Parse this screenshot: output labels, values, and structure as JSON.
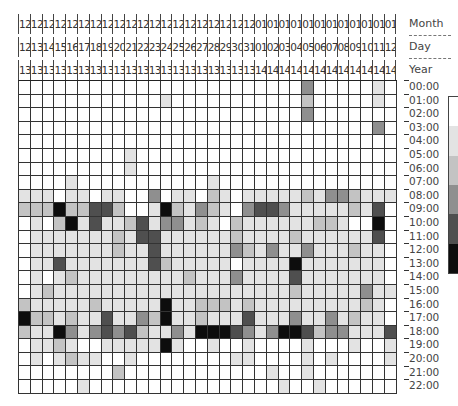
{
  "chart_data": {
    "type": "heatmap",
    "title": "",
    "axis_labels": {
      "month": "Month",
      "day": "Day",
      "year": "Year"
    },
    "columns": [
      {
        "month": "12",
        "day": "12",
        "year": "13"
      },
      {
        "month": "12",
        "day": "13",
        "year": "13"
      },
      {
        "month": "12",
        "day": "14",
        "year": "13"
      },
      {
        "month": "12",
        "day": "15",
        "year": "13"
      },
      {
        "month": "12",
        "day": "16",
        "year": "13"
      },
      {
        "month": "12",
        "day": "17",
        "year": "13"
      },
      {
        "month": "12",
        "day": "18",
        "year": "13"
      },
      {
        "month": "12",
        "day": "19",
        "year": "13"
      },
      {
        "month": "12",
        "day": "20",
        "year": "13"
      },
      {
        "month": "12",
        "day": "21",
        "year": "13"
      },
      {
        "month": "12",
        "day": "22",
        "year": "13"
      },
      {
        "month": "12",
        "day": "23",
        "year": "13"
      },
      {
        "month": "12",
        "day": "24",
        "year": "13"
      },
      {
        "month": "12",
        "day": "25",
        "year": "13"
      },
      {
        "month": "12",
        "day": "26",
        "year": "13"
      },
      {
        "month": "12",
        "day": "27",
        "year": "13"
      },
      {
        "month": "12",
        "day": "28",
        "year": "13"
      },
      {
        "month": "12",
        "day": "29",
        "year": "13"
      },
      {
        "month": "12",
        "day": "30",
        "year": "13"
      },
      {
        "month": "12",
        "day": "31",
        "year": "13"
      },
      {
        "month": "01",
        "day": "01",
        "year": "14"
      },
      {
        "month": "01",
        "day": "02",
        "year": "14"
      },
      {
        "month": "01",
        "day": "03",
        "year": "14"
      },
      {
        "month": "01",
        "day": "04",
        "year": "14"
      },
      {
        "month": "01",
        "day": "05",
        "year": "14"
      },
      {
        "month": "01",
        "day": "06",
        "year": "14"
      },
      {
        "month": "01",
        "day": "07",
        "year": "14"
      },
      {
        "month": "01",
        "day": "08",
        "year": "14"
      },
      {
        "month": "01",
        "day": "09",
        "year": "14"
      },
      {
        "month": "01",
        "day": "10",
        "year": "14"
      },
      {
        "month": "01",
        "day": "11",
        "year": "14"
      },
      {
        "month": "01",
        "day": "12",
        "year": "14"
      }
    ],
    "rows": [
      "00:00",
      "01:00",
      "02:00",
      "03:00",
      "04:00",
      "05:00",
      "06:00",
      "07:00",
      "08:00",
      "09:00",
      "10:00",
      "11:00",
      "12:00",
      "13:00",
      "14:00",
      "15:00",
      "16:00",
      "17:00",
      "18:00",
      "19:00",
      "20:00",
      "21:00",
      "22:00"
    ],
    "value_scale": "0 (white) to 5 (black), estimated intensity",
    "values": [
      [
        0,
        0,
        0,
        0,
        0,
        0,
        0,
        0,
        0,
        0,
        0,
        0,
        0,
        0,
        0,
        0,
        0,
        0,
        0,
        0,
        0,
        0,
        0,
        0,
        3,
        0,
        0,
        0,
        0,
        0,
        1,
        0
      ],
      [
        0,
        0,
        0,
        0,
        0,
        0,
        0,
        0,
        0,
        0,
        0,
        0,
        1,
        0,
        0,
        0,
        0,
        0,
        0,
        0,
        0,
        0,
        0,
        0,
        2,
        0,
        0,
        0,
        0,
        0,
        1,
        0
      ],
      [
        0,
        0,
        0,
        0,
        0,
        0,
        0,
        0,
        0,
        0,
        0,
        0,
        0,
        0,
        0,
        0,
        0,
        0,
        0,
        0,
        0,
        0,
        0,
        0,
        3,
        0,
        0,
        0,
        0,
        0,
        0,
        0
      ],
      [
        0,
        0,
        0,
        0,
        0,
        0,
        0,
        0,
        0,
        0,
        0,
        0,
        0,
        0,
        0,
        0,
        0,
        0,
        0,
        0,
        0,
        0,
        0,
        0,
        0,
        0,
        0,
        0,
        0,
        0,
        3,
        0
      ],
      [
        0,
        0,
        0,
        0,
        0,
        0,
        0,
        0,
        0,
        0,
        0,
        0,
        0,
        0,
        0,
        0,
        0,
        0,
        0,
        0,
        0,
        0,
        0,
        0,
        0,
        0,
        0,
        0,
        0,
        0,
        0,
        0
      ],
      [
        0,
        0,
        0,
        0,
        0,
        0,
        0,
        0,
        0,
        1,
        0,
        0,
        0,
        0,
        0,
        0,
        0,
        0,
        0,
        0,
        0,
        0,
        0,
        0,
        0,
        0,
        0,
        0,
        0,
        0,
        0,
        0
      ],
      [
        0,
        0,
        0,
        0,
        0,
        0,
        0,
        0,
        0,
        1,
        0,
        0,
        0,
        0,
        0,
        0,
        0,
        0,
        0,
        0,
        0,
        0,
        0,
        0,
        0,
        0,
        0,
        0,
        0,
        0,
        0,
        0
      ],
      [
        0,
        0,
        0,
        0,
        1,
        0,
        0,
        0,
        0,
        0,
        0,
        0,
        0,
        0,
        0,
        0,
        1,
        0,
        0,
        0,
        0,
        0,
        0,
        0,
        0,
        0,
        0,
        0,
        0,
        0,
        0,
        0
      ],
      [
        1,
        1,
        1,
        0,
        1,
        1,
        0,
        1,
        1,
        0,
        0,
        3,
        0,
        1,
        1,
        0,
        2,
        1,
        0,
        1,
        1,
        1,
        1,
        1,
        2,
        1,
        3,
        3,
        2,
        1,
        1,
        1
      ],
      [
        2,
        2,
        2,
        5,
        2,
        2,
        4,
        4,
        2,
        0,
        0,
        1,
        5,
        2,
        1,
        3,
        2,
        1,
        0,
        3,
        4,
        4,
        3,
        1,
        1,
        1,
        1,
        1,
        2,
        1,
        4,
        0
      ],
      [
        0,
        1,
        0,
        2,
        5,
        1,
        4,
        1,
        1,
        2,
        4,
        1,
        3,
        3,
        1,
        2,
        1,
        0,
        2,
        1,
        1,
        1,
        1,
        1,
        1,
        2,
        2,
        1,
        0,
        0,
        5,
        0
      ],
      [
        0,
        1,
        1,
        1,
        1,
        1,
        1,
        1,
        2,
        1,
        4,
        4,
        1,
        1,
        1,
        1,
        1,
        1,
        2,
        1,
        1,
        1,
        1,
        2,
        1,
        1,
        1,
        1,
        1,
        1,
        4,
        0
      ],
      [
        0,
        1,
        1,
        1,
        1,
        1,
        1,
        1,
        2,
        1,
        1,
        4,
        1,
        1,
        1,
        1,
        1,
        1,
        3,
        2,
        1,
        3,
        1,
        1,
        3,
        1,
        1,
        1,
        2,
        1,
        1,
        0
      ],
      [
        0,
        1,
        1,
        4,
        1,
        1,
        1,
        1,
        1,
        1,
        1,
        4,
        2,
        1,
        1,
        1,
        1,
        1,
        0,
        1,
        1,
        1,
        1,
        5,
        1,
        1,
        1,
        1,
        1,
        1,
        1,
        0
      ],
      [
        0,
        1,
        0,
        1,
        2,
        1,
        1,
        1,
        1,
        1,
        1,
        1,
        1,
        1,
        2,
        1,
        1,
        1,
        3,
        1,
        1,
        1,
        1,
        4,
        1,
        1,
        1,
        1,
        1,
        1,
        1,
        0
      ],
      [
        0,
        1,
        2,
        1,
        1,
        1,
        1,
        1,
        1,
        1,
        1,
        1,
        1,
        1,
        1,
        1,
        1,
        1,
        1,
        1,
        1,
        1,
        1,
        2,
        1,
        1,
        1,
        1,
        1,
        3,
        1,
        1
      ],
      [
        2,
        1,
        1,
        1,
        1,
        1,
        2,
        1,
        1,
        1,
        1,
        1,
        5,
        1,
        1,
        2,
        2,
        2,
        1,
        2,
        1,
        1,
        1,
        1,
        1,
        1,
        1,
        1,
        1,
        2,
        1,
        0
      ],
      [
        5,
        2,
        2,
        1,
        2,
        1,
        1,
        4,
        1,
        1,
        3,
        2,
        5,
        1,
        1,
        2,
        1,
        1,
        1,
        4,
        1,
        1,
        1,
        3,
        1,
        1,
        3,
        1,
        2,
        1,
        1,
        0
      ],
      [
        2,
        1,
        1,
        5,
        3,
        1,
        3,
        4,
        3,
        4,
        2,
        1,
        1,
        3,
        1,
        5,
        5,
        5,
        4,
        3,
        1,
        3,
        5,
        5,
        4,
        2,
        3,
        3,
        1,
        1,
        1,
        4
      ],
      [
        0,
        1,
        1,
        2,
        1,
        0,
        0,
        1,
        1,
        1,
        1,
        1,
        5,
        1,
        0,
        0,
        1,
        0,
        0,
        1,
        0,
        0,
        0,
        0,
        1,
        0,
        0,
        0,
        1,
        0,
        0,
        1
      ],
      [
        0,
        1,
        0,
        1,
        2,
        1,
        1,
        0,
        0,
        1,
        0,
        0,
        0,
        0,
        0,
        0,
        0,
        0,
        1,
        1,
        0,
        0,
        0,
        0,
        1,
        0,
        1,
        0,
        0,
        0,
        0,
        1
      ],
      [
        0,
        0,
        0,
        0,
        0,
        0,
        0,
        0,
        2,
        0,
        0,
        0,
        0,
        0,
        0,
        0,
        0,
        0,
        0,
        0,
        0,
        1,
        0,
        0,
        1,
        0,
        0,
        0,
        0,
        0,
        0,
        0
      ],
      [
        0,
        0,
        0,
        0,
        0,
        1,
        0,
        0,
        0,
        0,
        0,
        0,
        0,
        0,
        0,
        0,
        0,
        0,
        0,
        0,
        0,
        0,
        1,
        0,
        0,
        1,
        0,
        0,
        0,
        0,
        0,
        0
      ]
    ],
    "legend": {
      "position": "right",
      "type": "grayscale-gradient",
      "partially_visible": true
    },
    "grid": true
  },
  "colors": {
    "levels": [
      "#ffffff",
      "#e3e3e3",
      "#c3c3c3",
      "#8f8f8f",
      "#4f4f4f",
      "#0d0d0d"
    ],
    "grid_line": "#333333",
    "text": "#333333"
  }
}
